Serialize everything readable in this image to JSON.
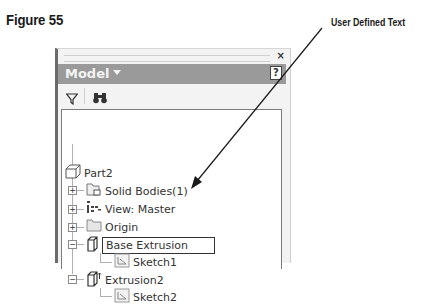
{
  "figure": {
    "title": "Figure 55"
  },
  "callout": {
    "text": "User Defined Text"
  },
  "panel": {
    "close_glyph": "×",
    "title": "Model",
    "help_glyph": "?",
    "toolbar": {
      "filter_icon": "funnel-icon",
      "find_icon": "binoculars-icon"
    },
    "tree": [
      {
        "label": "Part2",
        "icon": "part-cube-icon",
        "level": 0,
        "expander": ""
      },
      {
        "label": "Solid Bodies(1)",
        "icon": "solid-bodies-folder-icon",
        "level": 1,
        "expander": "+"
      },
      {
        "label": "View: Master",
        "icon": "view-rep-icon",
        "level": 1,
        "expander": "+"
      },
      {
        "label": "Origin",
        "icon": "folder-icon",
        "level": 1,
        "expander": "+"
      },
      {
        "label": "Base Extrusion",
        "icon": "extrusion-icon",
        "level": 1,
        "expander": "−",
        "editing": true
      },
      {
        "label": "Sketch1",
        "icon": "sketch-icon",
        "level": 2,
        "expander": ""
      },
      {
        "label": "Extrusion2",
        "icon": "extrusion-icon",
        "level": 1,
        "expander": "−"
      },
      {
        "label": "Sketch2",
        "icon": "sketch-icon",
        "level": 2,
        "expander": ""
      }
    ]
  },
  "colors": {
    "titlebar_bg": "#9a9a9a",
    "panel_bg": "#f3f3f3",
    "tree_bg": "#ffffff",
    "text": "#333333",
    "arrow": "#1a1a1a"
  }
}
